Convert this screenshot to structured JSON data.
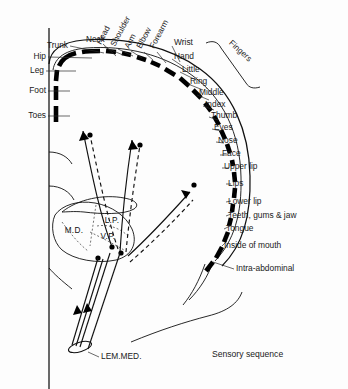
{
  "figure": {
    "title": "Sensory sequence",
    "caption": "Sensory sequence",
    "caption_x": 212,
    "caption_y": 357
  },
  "left_labels": [
    {
      "text": "Trunk",
      "x": 68,
      "y": 46,
      "lx1": 70,
      "ly1": 46,
      "lx2": 104,
      "ly2": 53
    },
    {
      "text": "Hip",
      "x": 46,
      "y": 57,
      "lx1": 48,
      "ly1": 57,
      "lx2": 92,
      "ly2": 58
    },
    {
      "text": "Leg",
      "x": 44,
      "y": 71,
      "lx1": 46,
      "ly1": 71,
      "lx2": 76,
      "ly2": 71
    },
    {
      "text": "Foot",
      "x": 46,
      "y": 91,
      "lx1": 48,
      "ly1": 91,
      "lx2": 70,
      "ly2": 91
    },
    {
      "text": "Toes",
      "x": 46,
      "y": 116,
      "lx1": 48,
      "ly1": 116,
      "lx2": 70,
      "ly2": 116
    }
  ],
  "rotated_labels": [
    {
      "text": "Neck",
      "x": 86,
      "y": 40,
      "rot": 0,
      "lx1": 103,
      "ly1": 44,
      "lx2": 116,
      "ly2": 56
    },
    {
      "text": "Head",
      "x": 99,
      "y": 44,
      "rot": -62,
      "lx1": 104,
      "ly1": 47,
      "lx2": 123,
      "ly2": 55
    },
    {
      "text": "Shoulder",
      "x": 113,
      "y": 46,
      "rot": -62,
      "lx1": 118,
      "ly1": 49,
      "lx2": 133,
      "ly2": 56
    },
    {
      "text": "Arm",
      "x": 127,
      "y": 48,
      "rot": -62,
      "lx1": 131,
      "ly1": 51,
      "lx2": 142,
      "ly2": 58
    },
    {
      "text": "Elbow",
      "x": 139,
      "y": 48,
      "rot": -62,
      "lx1": 144,
      "ly1": 52,
      "lx2": 153,
      "ly2": 60
    },
    {
      "text": "Forearm",
      "x": 152,
      "y": 48,
      "rot": -62,
      "lx1": 157,
      "ly1": 52,
      "lx2": 166,
      "ly2": 63
    },
    {
      "text": "Fingers",
      "x": 230,
      "y": 42,
      "rot": 42,
      "lx1": 0,
      "ly1": 0,
      "lx2": 0,
      "ly2": 0
    }
  ],
  "right_labels": [
    {
      "text": "Wrist",
      "x": 174,
      "y": 43,
      "lx1": 172,
      "ly1": 46,
      "lx2": 180,
      "ly2": 62
    },
    {
      "text": "Hand",
      "x": 174,
      "y": 57,
      "lx1": 172,
      "ly1": 59,
      "lx2": 188,
      "ly2": 70
    },
    {
      "text": "Little",
      "x": 182,
      "y": 70,
      "lx1": 180,
      "ly1": 72,
      "lx2": 196,
      "ly2": 80
    },
    {
      "text": "Ring",
      "x": 190,
      "y": 82,
      "lx1": 188,
      "ly1": 84,
      "lx2": 203,
      "ly2": 90
    },
    {
      "text": "Middle",
      "x": 199,
      "y": 93,
      "lx1": 197,
      "ly1": 95,
      "lx2": 209,
      "ly2": 100
    },
    {
      "text": "Index",
      "x": 205,
      "y": 105,
      "lx1": 203,
      "ly1": 106,
      "lx2": 214,
      "ly2": 110
    },
    {
      "text": "Thumb",
      "x": 211,
      "y": 116,
      "lx1": 209,
      "ly1": 117,
      "lx2": 218,
      "ly2": 120
    },
    {
      "text": "Eyes",
      "x": 214,
      "y": 128,
      "lx1": 212,
      "ly1": 129,
      "lx2": 221,
      "ly2": 131
    },
    {
      "text": "Nose",
      "x": 218,
      "y": 141,
      "lx1": 216,
      "ly1": 142,
      "lx2": 224,
      "ly2": 143
    },
    {
      "text": "Face",
      "x": 222,
      "y": 154,
      "lx1": 220,
      "ly1": 155,
      "lx2": 227,
      "ly2": 155
    },
    {
      "text": "Upper lip",
      "x": 224,
      "y": 167,
      "lx1": 222,
      "ly1": 168,
      "lx2": 229,
      "ly2": 168
    },
    {
      "text": "Lips",
      "x": 228,
      "y": 184,
      "lx1": 226,
      "ly1": 184,
      "lx2": 231,
      "ly2": 184
    },
    {
      "text": "Lower lip",
      "x": 228,
      "y": 202,
      "lx1": 226,
      "ly1": 202,
      "lx2": 231,
      "ly2": 201
    },
    {
      "text": "Teeth, gums & jaw",
      "x": 228,
      "y": 216,
      "lx1": 226,
      "ly1": 216,
      "lx2": 231,
      "ly2": 214
    },
    {
      "text": "Tongue",
      "x": 226,
      "y": 229,
      "lx1": 224,
      "ly1": 229,
      "lx2": 230,
      "ly2": 226
    },
    {
      "text": "Inside of mouth",
      "x": 224,
      "y": 246,
      "lx1": 222,
      "ly1": 246,
      "lx2": 227,
      "ly2": 241
    },
    {
      "text": "Intra-abdominal",
      "x": 236,
      "y": 269,
      "lx1": 234,
      "ly1": 269,
      "lx2": 213,
      "ly2": 262
    }
  ],
  "nuclei": [
    {
      "text": "M.D.",
      "x": 74,
      "y": 233
    },
    {
      "text": "L.P.",
      "x": 112,
      "y": 223
    },
    {
      "text": "V.P.",
      "x": 108,
      "y": 239
    }
  ],
  "tract_label": {
    "text": "LEM.MED.",
    "x": 86,
    "y": 357
  },
  "colors": {
    "ink": "#111111",
    "background": "#fdfdfd",
    "band": "#000000",
    "leader": "#2a2a2a"
  }
}
